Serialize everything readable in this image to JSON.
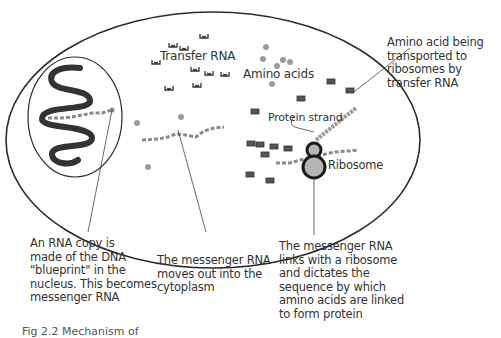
{
  "figure": {
    "labels": {
      "transfer_rna": "Transfer RNA",
      "amino_acids": "Amino acids",
      "protein_strand": "Protein strand",
      "ribosome": "Ribosome"
    },
    "callouts": {
      "amino_transport": [
        "Amino acid being",
        "transported to",
        "ribosomes by",
        "transfer RNA"
      ],
      "rna_copy": [
        "An RNA copy is",
        "made of the DNA",
        "\"blueprint\" in the",
        "nucleus. This becomes",
        "messenger RNA"
      ],
      "mrna_moves": [
        "The messenger RNA",
        "moves out into the",
        "cytoplasm"
      ],
      "mrna_links": [
        "The messenger RNA",
        "links with a ribosome",
        "and dictates the",
        "sequence by which",
        "amino acids are linked",
        "to form protein"
      ]
    },
    "caption": "Fig 2.2   Mechanism of"
  },
  "colors": {
    "outline": "#2b2b2b",
    "dna": "#333333",
    "rna": "#8a8a8a",
    "amino": "#9a9a9a",
    "ribosome_fill": "#b5b5b5"
  }
}
